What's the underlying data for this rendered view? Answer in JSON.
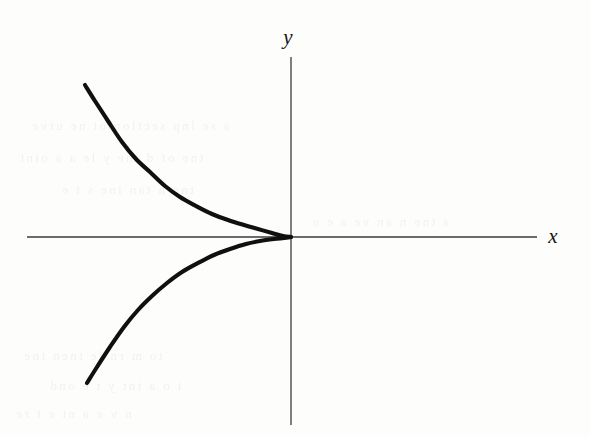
{
  "figure": {
    "background_color": "#fdfdfb",
    "ink_color": "#101010",
    "axis_color": "#3b3b3b",
    "width": 590,
    "height": 436,
    "x_axis_label": "x",
    "y_axis_label": "y",
    "scan_artifact_note": "faint illegible reverse-side bleed-through text"
  },
  "ghost_text": {
    "lines": [
      "a se lnp sectlon ot ne urve",
      "tne of d tne y le a a oint",
      "tne  n tan  ine  s t e",
      "to  m  rn  le  tnen tne",
      "i o  a tnt y t   e  ond",
      "n  v  e a  nt  e  t re",
      "a  tne  n  an  ve a e  u"
    ]
  },
  "chart_data": {
    "type": "line",
    "title": "",
    "subtitle": "",
    "xlabel": "x",
    "ylabel": "y",
    "grid": false,
    "legend": null,
    "annotations": [],
    "curve_description": "Cusp curve (semicubical parabola opening to the left) with a single cusp point at the origin; the two symmetric branches lie entirely in the second and third quadrants and are tangent to the negative x-axis at the origin.",
    "equation": "x = -y^(2/3)",
    "cusp_point": [
      0,
      0
    ],
    "axis_pixels": {
      "origin": [
        291,
        237
      ],
      "x_axis_start": [
        27,
        237
      ],
      "x_axis_end": [
        537,
        237
      ],
      "y_axis_start": [
        291,
        57
      ],
      "y_axis_end": [
        291,
        425
      ],
      "x_label_pos": [
        553,
        243
      ],
      "y_label_pos": [
        288,
        44
      ]
    },
    "series": [
      {
        "name": "upper branch",
        "points_pixels": [
          [
            85,
            85
          ],
          [
            95,
            101
          ],
          [
            108,
            121
          ],
          [
            122,
            142
          ],
          [
            136,
            159
          ],
          [
            150,
            172
          ],
          [
            165,
            186
          ],
          [
            180,
            197
          ],
          [
            196,
            206
          ],
          [
            212,
            214
          ],
          [
            228,
            220
          ],
          [
            244,
            225
          ],
          [
            258,
            229
          ],
          [
            272,
            233
          ],
          [
            283,
            236
          ],
          [
            291,
            237
          ]
        ]
      },
      {
        "name": "lower branch",
        "points_pixels": [
          [
            87,
            383
          ],
          [
            97,
            367
          ],
          [
            110,
            347
          ],
          [
            124,
            327
          ],
          [
            138,
            310
          ],
          [
            152,
            296
          ],
          [
            167,
            283
          ],
          [
            182,
            272
          ],
          [
            198,
            263
          ],
          [
            214,
            255
          ],
          [
            230,
            249
          ],
          [
            246,
            244
          ],
          [
            260,
            241
          ],
          [
            274,
            239
          ],
          [
            284,
            238
          ],
          [
            291,
            237
          ]
        ]
      }
    ],
    "xlim_pixels": [
      27,
      537
    ],
    "ylim_pixels": [
      57,
      425
    ]
  }
}
